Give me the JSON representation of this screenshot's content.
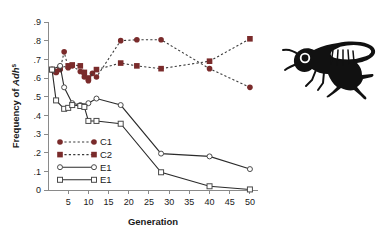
{
  "figure": {
    "name": "adh-frequency-generation-chart",
    "illustration": {
      "name": "drosophila-fly-illustration",
      "description": "fruit-fly-line-art"
    }
  },
  "chart_data": {
    "type": "line",
    "title": "",
    "xlabel": "Generation",
    "ylabel": "Frequency of Adhˢ",
    "ylabel_parts": {
      "prefix": "Frequency of ",
      "italic": "Adh",
      "superscript": "s"
    },
    "xlim": [
      0,
      52
    ],
    "ylim": [
      0,
      0.9
    ],
    "xticks": [
      5,
      10,
      15,
      20,
      25,
      30,
      35,
      40,
      45,
      50
    ],
    "xticklabels": [
      "5",
      "10",
      "15",
      "20",
      "25",
      "30",
      "35",
      "40",
      "45",
      "50"
    ],
    "yticks": [
      0,
      0.1,
      0.2,
      0.3,
      0.4,
      0.5,
      0.6,
      0.7,
      0.8,
      0.9
    ],
    "yticklabels": [
      "0",
      ".1",
      ".2",
      ".3",
      ".4",
      ".5",
      ".6",
      ".7",
      ".8",
      ".9"
    ],
    "grid": false,
    "legend_position": "inside-lower-left",
    "colors": {
      "control_marker": "#7a2b2b",
      "control_line": "#3a3a3a",
      "experimental_line": "#2b2b2b",
      "experimental_marker_fill": "#ffffff",
      "experimental_marker_stroke": "#4a4a4a",
      "axis": "#8a8a8a",
      "text": "#1a1a1a",
      "background": "#ffffff"
    },
    "series": [
      {
        "name": "C1",
        "label": "C1",
        "marker": "circle",
        "marker_style": "filled",
        "line_style": "dashed",
        "color": "#7a2b2b",
        "x": [
          1,
          2,
          3,
          4,
          5,
          6,
          8,
          9,
          10,
          11,
          12,
          18,
          22,
          28,
          40,
          50
        ],
        "y": [
          0.645,
          0.63,
          0.645,
          0.74,
          0.655,
          0.665,
          0.635,
          0.605,
          0.585,
          0.625,
          0.605,
          0.8,
          0.805,
          0.805,
          0.65,
          0.55
        ]
      },
      {
        "name": "C2",
        "label": "C2",
        "marker": "square",
        "marker_style": "filled",
        "line_style": "dashed",
        "color": "#7a2b2b",
        "x": [
          1,
          2,
          3,
          5,
          6,
          8,
          9,
          10,
          12,
          18,
          22,
          28,
          40,
          50
        ],
        "y": [
          0.645,
          0.635,
          0.655,
          0.665,
          0.67,
          0.665,
          0.63,
          0.6,
          0.645,
          0.68,
          0.665,
          0.65,
          0.69,
          0.81
        ]
      },
      {
        "name": "E1",
        "label": "E1",
        "marker": "circle",
        "marker_style": "open",
        "line_style": "solid",
        "color": "#2b2b2b",
        "x": [
          1,
          3,
          4,
          6,
          8,
          9,
          10,
          12,
          18,
          28,
          40,
          50
        ],
        "y": [
          0.645,
          0.665,
          0.55,
          0.465,
          0.455,
          0.45,
          0.465,
          0.49,
          0.455,
          0.195,
          0.18,
          0.112
        ]
      },
      {
        "name": "E1b",
        "label": "E1",
        "marker": "square",
        "marker_style": "open",
        "line_style": "solid",
        "color": "#2b2b2b",
        "x": [
          1,
          2,
          4,
          5,
          6,
          8,
          9,
          10,
          12,
          18,
          28,
          40,
          50
        ],
        "y": [
          0.645,
          0.48,
          0.435,
          0.44,
          0.455,
          0.45,
          0.445,
          0.37,
          0.37,
          0.355,
          0.095,
          0.02,
          0.003
        ]
      }
    ],
    "legend": [
      {
        "label": "C1",
        "marker": "circle",
        "marker_style": "filled",
        "line_style": "dashed",
        "color": "#7a2b2b"
      },
      {
        "label": "C2",
        "marker": "square",
        "marker_style": "filled",
        "line_style": "dashed",
        "color": "#7a2b2b"
      },
      {
        "label": "E1",
        "marker": "circle",
        "marker_style": "open",
        "line_style": "solid",
        "color": "#2b2b2b"
      },
      {
        "label": "E1",
        "marker": "square",
        "marker_style": "open",
        "line_style": "solid",
        "color": "#2b2b2b"
      }
    ]
  }
}
